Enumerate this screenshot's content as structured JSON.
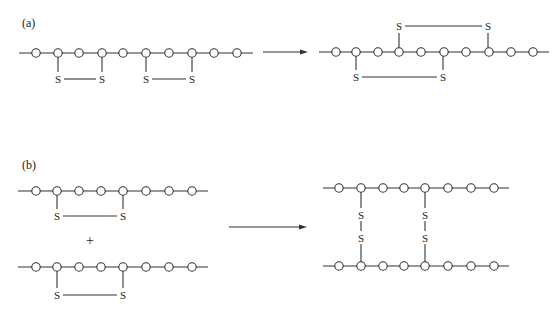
{
  "figure": {
    "colors": {
      "ink": "#333333",
      "background": "#ffffff"
    },
    "atom_symbol": "O",
    "sulfur_symbol": "S",
    "panels": [
      {
        "label": "(a)",
        "label_pos": [
          22,
          27
        ],
        "reactants": [
          {
            "chain_y": 53,
            "dash_start": 19,
            "dash_end": 253,
            "atoms_x": [
              36,
              58,
              79,
              102,
              123,
              146,
              169,
              192,
              214,
              237
            ],
            "bridges": [
              {
                "from_x": 58,
                "to_x": 102,
                "side": "below",
                "s_y": 79
              },
              {
                "from_x": 146,
                "to_x": 192,
                "side": "below",
                "s_y": 79
              }
            ]
          }
        ],
        "arrow": {
          "x1": 263,
          "x2": 308,
          "y": 52
        },
        "products": [
          {
            "chain_y": 52,
            "dash_start": 319,
            "dash_end": 549,
            "atoms_x": [
              336,
              356,
              378,
              399,
              421,
              444,
              466,
              489,
              511,
              533
            ],
            "bridges": [
              {
                "from_x": 399,
                "to_x": 488,
                "side": "above",
                "s_y": 26
              },
              {
                "from_x": 356,
                "to_x": 443,
                "side": "below",
                "s_y": 77
              }
            ]
          }
        ]
      },
      {
        "label": "(b)",
        "label_pos": [
          22,
          169
        ],
        "reactants": [
          {
            "chain_y": 191,
            "dash_start": 18,
            "dash_end": 208,
            "atoms_x": [
              36,
              57,
              79,
              101,
              123,
              146,
              169,
              192
            ],
            "bridges": [
              {
                "from_x": 57,
                "to_x": 123,
                "side": "below",
                "s_y": 216
              }
            ]
          },
          {
            "chain_y": 267,
            "dash_start": 18,
            "dash_end": 208,
            "atoms_x": [
              36,
              57,
              79,
              101,
              123,
              146,
              169,
              192
            ],
            "bridges": [
              {
                "from_x": 57,
                "to_x": 123,
                "side": "below",
                "s_y": 295
              }
            ]
          }
        ],
        "plus": {
          "text": "+",
          "x": 90,
          "y": 245
        },
        "arrow": {
          "x1": 229,
          "x2": 307,
          "y": 227
        },
        "product": {
          "top_chain_y": 188,
          "bottom_chain_y": 266,
          "dash_start": 323,
          "dash_end": 509,
          "atoms_x": [
            339,
            361,
            383,
            404,
            425,
            448,
            471,
            494
          ],
          "crosslinks_x": [
            361,
            425
          ],
          "s_y": [
            215,
            238
          ]
        }
      }
    ]
  }
}
